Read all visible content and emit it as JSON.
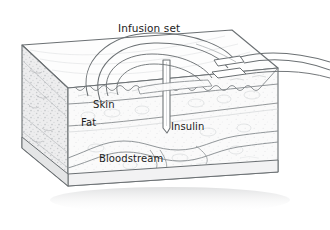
{
  "illustration": {
    "title": "Insulin pump infusion set inserted into subcutaneous tissue",
    "type": "medical-cross-section-diagram",
    "background_color": "#ffffff",
    "line_color": "#5a5f63",
    "label_color": "#1c1c1c",
    "tissue_fill": "#fbfbfb",
    "side_face_fill": "#ededee",
    "bottom_face_fill": "#f4f4f4"
  },
  "labels": {
    "infusion_set": "Infusion set",
    "skin": "Skin",
    "fat": "Fat",
    "insulin": "Insulin",
    "bloodstream": "Bloodstream"
  },
  "parts": {
    "tissue_block": "tissue-block",
    "skin_layer": "skin-layer",
    "fat_layer": "fat-layer",
    "cannula": "cannula",
    "tubing": "infusion-tubing",
    "blood_vessel": "blood-vessel"
  }
}
